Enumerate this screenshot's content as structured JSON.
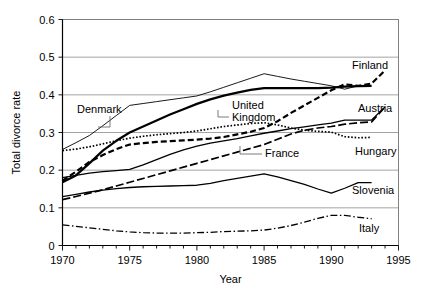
{
  "figure": {
    "width": 423,
    "height": 297,
    "background": "#ffffff"
  },
  "caption_fragment": "",
  "chart_data": {
    "type": "line",
    "title": "",
    "xlabel": "Year",
    "ylabel": "Total divorce rate",
    "xlim": [
      1970,
      1995
    ],
    "ylim": [
      0,
      0.6
    ],
    "grid": true,
    "grid_axis": "y",
    "legend_position": "inline-labels",
    "xticks": [
      1970,
      1975,
      1980,
      1985,
      1990,
      1995
    ],
    "xtick_labels": [
      "1970",
      "1975",
      "1980",
      "1985",
      "1990",
      "1995"
    ],
    "xminor_interval": 1,
    "yticks": [
      0,
      0.1,
      0.2,
      0.3,
      0.4,
      0.5,
      0.6
    ],
    "ytick_labels": [
      "0",
      "0.1",
      "0.2",
      "0.3",
      "0.4",
      "0.5",
      "0.6"
    ],
    "series": [
      {
        "name": "Denmark",
        "label": "Denmark",
        "style": "solid-thin",
        "color": "#000000",
        "label_placement": "inline-left-leader",
        "x": [
          1970,
          1971,
          1972,
          1973,
          1974,
          1975,
          1976,
          1977,
          1978,
          1979,
          1980,
          1981,
          1982,
          1983,
          1984,
          1985,
          1986,
          1987,
          1988,
          1989,
          1990,
          1991,
          1992
        ],
        "values": [
          0.255,
          0.273,
          0.292,
          0.318,
          0.345,
          0.372,
          0.377,
          0.382,
          0.387,
          0.392,
          0.397,
          0.408,
          0.42,
          0.432,
          0.444,
          0.456,
          0.449,
          0.442,
          0.436,
          0.43,
          0.424,
          0.415,
          0.424
        ]
      },
      {
        "name": "United Kingdom",
        "label": "United Kingdom",
        "style": "solid-thick",
        "color": "#000000",
        "label_placement": "inline-leader",
        "x": [
          1970,
          1971,
          1972,
          1973,
          1974,
          1975,
          1976,
          1977,
          1978,
          1979,
          1980,
          1981,
          1982,
          1983,
          1984,
          1985,
          1986,
          1987,
          1988,
          1989,
          1990,
          1991,
          1992,
          1993
        ],
        "values": [
          0.168,
          0.186,
          0.218,
          0.252,
          0.278,
          0.3,
          0.316,
          0.332,
          0.348,
          0.362,
          0.376,
          0.388,
          0.398,
          0.406,
          0.413,
          0.418,
          0.418,
          0.418,
          0.418,
          0.418,
          0.419,
          0.422,
          0.423,
          0.424
        ]
      },
      {
        "name": "Finland",
        "label": "Finland",
        "style": "dashed-long",
        "color": "#000000",
        "label_placement": "right",
        "x": [
          1970,
          1971,
          1972,
          1973,
          1974,
          1975,
          1976,
          1977,
          1978,
          1979,
          1980,
          1981,
          1982,
          1983,
          1984,
          1985,
          1986,
          1987,
          1988,
          1989,
          1990,
          1991,
          1992,
          1993,
          1994
        ],
        "values": [
          0.172,
          0.196,
          0.222,
          0.24,
          0.256,
          0.268,
          0.272,
          0.275,
          0.277,
          0.279,
          0.281,
          0.284,
          0.288,
          0.295,
          0.302,
          0.312,
          0.33,
          0.352,
          0.372,
          0.392,
          0.412,
          0.428,
          0.424,
          0.43,
          0.465
        ]
      },
      {
        "name": "Hungary",
        "label": "Hungary",
        "style": "dotted",
        "color": "#000000",
        "label_placement": "right",
        "x": [
          1970,
          1971,
          1972,
          1973,
          1974,
          1975,
          1976,
          1977,
          1978,
          1979,
          1980,
          1981,
          1982,
          1983,
          1984,
          1985,
          1986,
          1987,
          1988,
          1989,
          1990,
          1991,
          1992,
          1993
        ],
        "values": [
          0.252,
          0.256,
          0.262,
          0.27,
          0.278,
          0.285,
          0.29,
          0.294,
          0.297,
          0.3,
          0.304,
          0.31,
          0.316,
          0.32,
          0.324,
          0.326,
          0.32,
          0.312,
          0.306,
          0.303,
          0.301,
          0.289,
          0.286,
          0.287
        ]
      },
      {
        "name": "Austria",
        "label": "Austria",
        "style": "solid-medium",
        "color": "#000000",
        "label_placement": "right",
        "x": [
          1970,
          1971,
          1972,
          1973,
          1974,
          1975,
          1976,
          1977,
          1978,
          1979,
          1980,
          1981,
          1982,
          1983,
          1984,
          1985,
          1986,
          1987,
          1988,
          1989,
          1990,
          1991,
          1992,
          1993,
          1994
        ],
        "values": [
          0.18,
          0.186,
          0.192,
          0.196,
          0.199,
          0.202,
          0.214,
          0.228,
          0.242,
          0.254,
          0.264,
          0.272,
          0.278,
          0.284,
          0.291,
          0.298,
          0.304,
          0.31,
          0.315,
          0.32,
          0.325,
          0.333,
          0.333,
          0.333,
          0.368
        ]
      },
      {
        "name": "France",
        "label": "France",
        "style": "dashdot-long",
        "color": "#000000",
        "label_placement": "inline-leader",
        "x": [
          1970,
          1971,
          1972,
          1973,
          1974,
          1975,
          1976,
          1977,
          1978,
          1979,
          1980,
          1981,
          1982,
          1983,
          1984,
          1985,
          1986,
          1987,
          1988,
          1989,
          1990,
          1991,
          1992,
          1993,
          1994
        ],
        "values": [
          0.122,
          0.13,
          0.139,
          0.148,
          0.158,
          0.168,
          0.178,
          0.188,
          0.198,
          0.208,
          0.218,
          0.228,
          0.238,
          0.248,
          0.258,
          0.268,
          0.282,
          0.296,
          0.306,
          0.312,
          0.316,
          0.322,
          0.326,
          0.328,
          0.368
        ]
      },
      {
        "name": "Slovenia",
        "label": "Slovenia",
        "style": "solid-medium",
        "color": "#000000",
        "label_placement": "right",
        "x": [
          1970,
          1971,
          1972,
          1973,
          1974,
          1975,
          1976,
          1977,
          1978,
          1979,
          1980,
          1981,
          1982,
          1983,
          1984,
          1985,
          1986,
          1987,
          1988,
          1989,
          1990,
          1991,
          1992,
          1993
        ],
        "values": [
          0.13,
          0.136,
          0.142,
          0.147,
          0.151,
          0.154,
          0.156,
          0.157,
          0.158,
          0.159,
          0.16,
          0.165,
          0.172,
          0.178,
          0.184,
          0.19,
          0.182,
          0.172,
          0.162,
          0.15,
          0.139,
          0.152,
          0.167,
          0.167
        ]
      },
      {
        "name": "Italy",
        "label": "Italy",
        "style": "dashdot",
        "color": "#000000",
        "label_placement": "right",
        "x": [
          1970,
          1971,
          1972,
          1973,
          1974,
          1975,
          1976,
          1977,
          1978,
          1979,
          1980,
          1981,
          1982,
          1983,
          1984,
          1985,
          1986,
          1987,
          1988,
          1989,
          1990,
          1991,
          1992,
          1993
        ],
        "values": [
          0.055,
          0.051,
          0.047,
          0.043,
          0.039,
          0.036,
          0.034,
          0.033,
          0.033,
          0.033,
          0.034,
          0.035,
          0.037,
          0.038,
          0.039,
          0.041,
          0.046,
          0.053,
          0.062,
          0.072,
          0.08,
          0.08,
          0.075,
          0.071
        ]
      }
    ]
  }
}
